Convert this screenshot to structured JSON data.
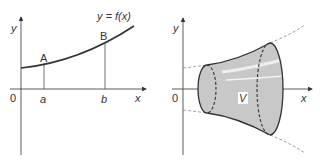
{
  "left_panel": {
    "y_axis_label": "y",
    "x_axis_label": "x",
    "origin_label": "0",
    "curve_label": "y = f(x)",
    "point_a_label": "A",
    "point_b_label": "B",
    "tick_a_label": "a",
    "tick_b_label": "b"
  },
  "right_panel": {
    "y_axis_label": "y",
    "x_axis_label": "x",
    "origin_label": "0",
    "volume_label": "V"
  },
  "colors": {
    "line": "#333333",
    "solid_fill": "#c8c8c8",
    "highlight": "#eeeeee",
    "dashed": "#777777"
  }
}
